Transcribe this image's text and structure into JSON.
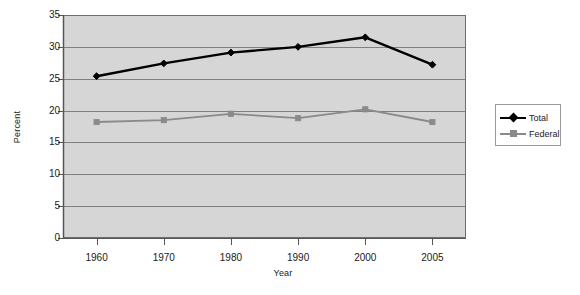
{
  "chart_data": {
    "type": "line",
    "title": "",
    "xlabel": "Year",
    "ylabel": "Percent",
    "categories": [
      "1960",
      "1970",
      "1980",
      "1990",
      "2000",
      "2005"
    ],
    "series": [
      {
        "name": "Total",
        "color": "#000000",
        "marker": "diamond",
        "values": [
          25.4,
          27.4,
          29.1,
          30.0,
          31.5,
          27.2
        ]
      },
      {
        "name": "Federal",
        "color": "#8a8a8a",
        "marker": "square",
        "values": [
          18.2,
          18.5,
          19.5,
          18.8,
          20.2,
          18.2
        ]
      }
    ],
    "ylim": [
      0,
      35
    ],
    "yticks": [
      "0",
      "5",
      "10",
      "15",
      "20",
      "25",
      "30",
      "35"
    ],
    "grid": true,
    "legend_position": "right",
    "plot_background": "#d6d6d6",
    "gridline_color": "#808080",
    "axis_color": "#6e6e6e"
  },
  "legend": {
    "entries": [
      {
        "label": "Total"
      },
      {
        "label": "Federal"
      }
    ]
  }
}
